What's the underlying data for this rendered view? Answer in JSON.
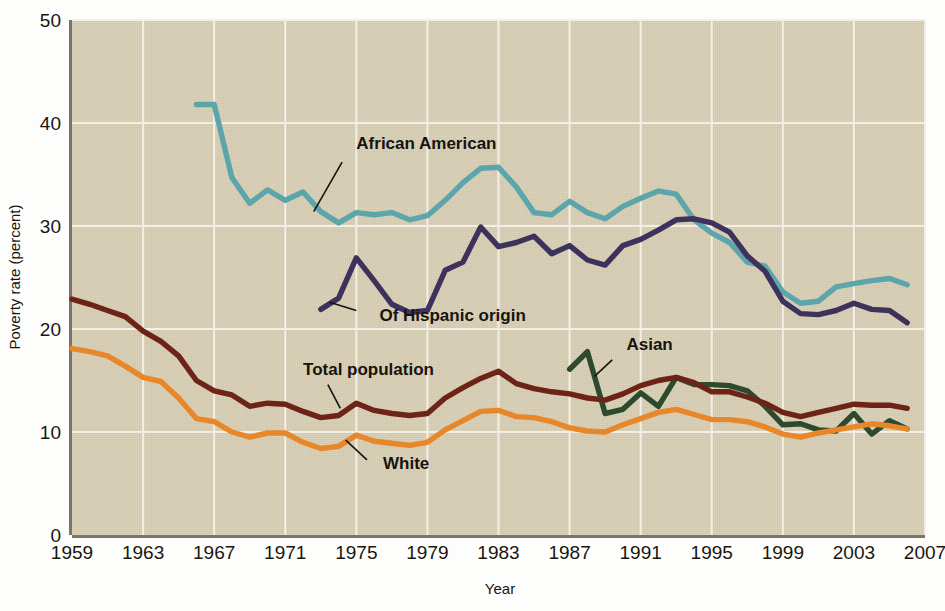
{
  "chart_data": {
    "type": "line",
    "title": "",
    "xlabel": "Year",
    "ylabel": "Poverty rate (percent)",
    "xlim": [
      1959,
      2007
    ],
    "ylim": [
      0,
      50
    ],
    "xticks": [
      "1959",
      "1963",
      "1967",
      "1971",
      "1975",
      "1979",
      "1983",
      "1987",
      "1991",
      "1995",
      "1999",
      "2003",
      "2007"
    ],
    "yticks": [
      "0",
      "10",
      "20",
      "30",
      "40",
      "50"
    ],
    "grid": "both",
    "legend_position": "inline-annotations",
    "series": [
      {
        "name": "African American",
        "color": "#5ba5ab",
        "label_x": 1975.0,
        "label_y": 37.5,
        "leader": [
          [
            1974.2,
            36.2
          ],
          [
            1972.6,
            31.4
          ]
        ],
        "x": [
          1966,
          1967,
          1968,
          1969,
          1970,
          1971,
          1972,
          1973,
          1974,
          1975,
          1976,
          1977,
          1978,
          1979,
          1980,
          1981,
          1982,
          1983,
          1984,
          1985,
          1986,
          1987,
          1988,
          1989,
          1990,
          1991,
          1992,
          1993,
          1994,
          1995,
          1996,
          1997,
          1998,
          1999,
          2000,
          2001,
          2002,
          2003,
          2004,
          2005,
          2006
        ],
        "y": [
          41.8,
          41.8,
          34.7,
          32.2,
          33.5,
          32.5,
          33.3,
          31.4,
          30.3,
          31.3,
          31.1,
          31.3,
          30.6,
          31.0,
          32.5,
          34.2,
          35.6,
          35.7,
          33.8,
          31.3,
          31.1,
          32.4,
          31.3,
          30.7,
          31.9,
          32.7,
          33.4,
          33.1,
          30.6,
          29.3,
          28.4,
          26.5,
          26.1,
          23.6,
          22.5,
          22.7,
          24.1,
          24.4,
          24.7,
          24.9,
          24.3
        ]
      },
      {
        "name": "Of Hispanic origin",
        "color": "#3c325c",
        "label_x": 1976.3,
        "label_y": 20.8,
        "leader": [
          [
            1975.0,
            21.8
          ],
          [
            1973.5,
            22.6
          ]
        ],
        "x": [
          1973,
          1974,
          1975,
          1976,
          1977,
          1978,
          1979,
          1980,
          1981,
          1982,
          1983,
          1984,
          1985,
          1986,
          1987,
          1988,
          1989,
          1990,
          1991,
          1992,
          1993,
          1994,
          1995,
          1996,
          1997,
          1998,
          1999,
          2000,
          2001,
          2002,
          2003,
          2004,
          2005,
          2006
        ],
        "y": [
          21.9,
          23.0,
          26.9,
          24.7,
          22.4,
          21.6,
          21.8,
          25.7,
          26.5,
          29.9,
          28.0,
          28.4,
          29.0,
          27.3,
          28.1,
          26.7,
          26.2,
          28.1,
          28.7,
          29.6,
          30.6,
          30.7,
          30.3,
          29.4,
          27.1,
          25.6,
          22.7,
          21.5,
          21.4,
          21.8,
          22.5,
          21.9,
          21.8,
          20.6
        ]
      },
      {
        "name": "Asian",
        "color": "#2d4a2e",
        "label_x": 1990.2,
        "label_y": 18.0,
        "leader": [
          [
            1989.4,
            17.0
          ],
          [
            1988.4,
            15.4
          ]
        ],
        "x": [
          1987,
          1988,
          1989,
          1990,
          1991,
          1992,
          1993,
          1994,
          1995,
          1996,
          1997,
          1998,
          1999,
          2000,
          2001,
          2002,
          2003,
          2004,
          2005,
          2006
        ],
        "y": [
          16.1,
          17.8,
          11.8,
          12.2,
          13.8,
          12.5,
          15.3,
          14.6,
          14.6,
          14.5,
          14.0,
          12.5,
          10.7,
          10.8,
          10.2,
          10.1,
          11.8,
          9.8,
          11.1,
          10.3
        ]
      },
      {
        "name": "Total population",
        "color": "#6d2316",
        "label_x": 1972.0,
        "label_y": 15.5,
        "leader": [
          [
            1973.4,
            14.6
          ],
          [
            1974.1,
            12.3
          ]
        ],
        "x": [
          1959,
          1960,
          1961,
          1962,
          1963,
          1964,
          1965,
          1966,
          1967,
          1968,
          1969,
          1970,
          1971,
          1972,
          1973,
          1974,
          1975,
          1976,
          1977,
          1978,
          1979,
          1980,
          1981,
          1982,
          1983,
          1984,
          1985,
          1986,
          1987,
          1988,
          1989,
          1990,
          1991,
          1992,
          1993,
          1994,
          1995,
          1996,
          1997,
          1998,
          1999,
          2000,
          2001,
          2002,
          2003,
          2004,
          2005,
          2006
        ],
        "y": [
          22.9,
          22.4,
          21.8,
          21.2,
          19.8,
          18.8,
          17.4,
          15.0,
          14.0,
          13.6,
          12.5,
          12.8,
          12.7,
          12.0,
          11.4,
          11.6,
          12.8,
          12.1,
          11.8,
          11.6,
          11.8,
          13.3,
          14.3,
          15.2,
          15.9,
          14.7,
          14.2,
          13.9,
          13.7,
          13.3,
          13.1,
          13.7,
          14.5,
          15.0,
          15.3,
          14.8,
          13.9,
          13.9,
          13.4,
          12.8,
          11.9,
          11.5,
          11.9,
          12.3,
          12.7,
          12.6,
          12.6,
          12.3
        ]
      },
      {
        "name": "White",
        "color": "#e8862a",
        "label_x": 1976.5,
        "label_y": 6.4,
        "leader": [
          [
            1975.6,
            7.3
          ],
          [
            1974.4,
            9.2
          ]
        ],
        "x": [
          1959,
          1960,
          1961,
          1962,
          1963,
          1964,
          1965,
          1966,
          1967,
          1968,
          1969,
          1970,
          1971,
          1972,
          1973,
          1974,
          1975,
          1976,
          1977,
          1978,
          1979,
          1980,
          1981,
          1982,
          1983,
          1984,
          1985,
          1986,
          1987,
          1988,
          1989,
          1990,
          1991,
          1992,
          1993,
          1994,
          1995,
          1996,
          1997,
          1998,
          1999,
          2000,
          2001,
          2002,
          2003,
          2004,
          2005,
          2006
        ],
        "y": [
          18.1,
          17.8,
          17.4,
          16.4,
          15.3,
          14.9,
          13.3,
          11.3,
          11.0,
          10.0,
          9.5,
          9.9,
          9.9,
          9.0,
          8.4,
          8.6,
          9.7,
          9.1,
          8.9,
          8.7,
          9.0,
          10.2,
          11.1,
          12.0,
          12.1,
          11.5,
          11.4,
          11.0,
          10.4,
          10.1,
          10.0,
          10.7,
          11.3,
          11.9,
          12.2,
          11.7,
          11.2,
          11.2,
          11.0,
          10.5,
          9.8,
          9.5,
          9.9,
          10.2,
          10.5,
          10.8,
          10.6,
          10.3
        ]
      }
    ]
  }
}
